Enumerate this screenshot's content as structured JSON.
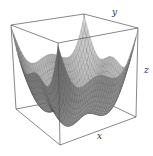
{
  "chart_data": {
    "type": "surface3d",
    "title": "",
    "function_description": "bowl-shaped surface with wavy rim: z = x^2 + y^2 + ripple, four peaks along each top edge",
    "xlabel": "x",
    "ylabel": "y",
    "zlabel": "z",
    "xrange": [
      -2,
      2
    ],
    "yrange": [
      -2,
      2
    ],
    "grid": false,
    "ticks": false,
    "mesh_lines": true,
    "surface_color": "#9a9a9a",
    "mesh_color": "#3a3a3a",
    "box_color": "#555555"
  }
}
